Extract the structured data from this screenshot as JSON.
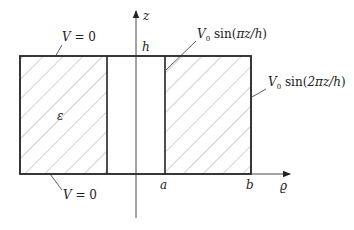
{
  "diagram": {
    "type": "cross-section",
    "axes": {
      "vertical": {
        "label": "z"
      },
      "horizontal": {
        "label": "ϱ"
      }
    },
    "tick_labels": {
      "h": "h",
      "a": "a",
      "b": "b"
    },
    "region_label": "ε",
    "boundary_labels": {
      "top": {
        "V": "V",
        "eq": " = 0"
      },
      "bottom": {
        "V": "V",
        "eq": " = 0"
      },
      "inner": {
        "V": "V",
        "sub": "0",
        "fn": " sin(",
        "arg": "πz/h",
        "close": ")"
      },
      "outer": {
        "V": "V",
        "sub": "0",
        "fn": " sin(",
        "arg": "2πz/h",
        "close": ")"
      }
    },
    "colors": {
      "outline": "#222222",
      "hatch": "#9a9a9a",
      "axis": "#333333",
      "background": "#ffffff"
    }
  }
}
